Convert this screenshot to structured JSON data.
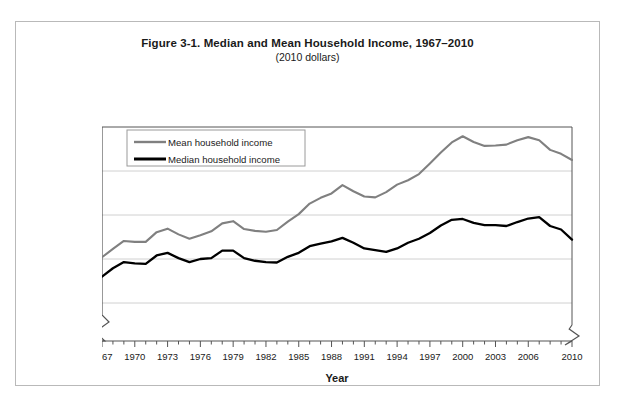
{
  "figure": {
    "title": "Figure 3-1. Median and Mean Household Income, 1967–2010",
    "subtitle": "(2010 dollars)"
  },
  "axes": {
    "y_title": "2010 dollars",
    "x_title": "Year",
    "y_ticks": [
      "75,000",
      "65,000",
      "55,000",
      "45,000",
      "35,000"
    ],
    "x_ticks": [
      "1967",
      "1970",
      "1973",
      "1976",
      "1979",
      "1982",
      "1985",
      "1988",
      "1991",
      "1994",
      "1997",
      "2000",
      "2003",
      "2006",
      "2010"
    ]
  },
  "legend": {
    "entries": [
      {
        "label": "Mean household income",
        "color": "#808080"
      },
      {
        "label": "Median household income",
        "color": "#000000"
      }
    ]
  },
  "colors": {
    "mean_line": "#808080",
    "median_line": "#000000",
    "gridline": "#d0d0d0",
    "axis": "#555555",
    "frame": "#b9b9b9"
  },
  "chart_data": {
    "type": "line",
    "title": "Figure 3-1. Median and Mean Household Income, 1967–2010",
    "subtitle": "(2010 dollars)",
    "xlabel": "Year",
    "ylabel": "2010 dollars",
    "ylim": [
      35000,
      75000
    ],
    "xlim": [
      1967,
      2010
    ],
    "grid": true,
    "y_axis_break": true,
    "legend_position": "upper-left-inside",
    "x": [
      1967,
      1968,
      1969,
      1970,
      1971,
      1972,
      1973,
      1974,
      1975,
      1976,
      1977,
      1978,
      1979,
      1980,
      1981,
      1982,
      1983,
      1984,
      1985,
      1986,
      1987,
      1988,
      1989,
      1990,
      1991,
      1992,
      1993,
      1994,
      1995,
      1996,
      1997,
      1998,
      1999,
      2000,
      2001,
      2002,
      2003,
      2004,
      2005,
      2006,
      2007,
      2008,
      2009,
      2010
    ],
    "series": [
      {
        "name": "Mean household income",
        "color": "#808080",
        "values": [
          45400,
          47300,
          49100,
          48900,
          48900,
          51100,
          51900,
          50600,
          49600,
          50400,
          51300,
          53100,
          53600,
          51800,
          51400,
          51200,
          51600,
          53500,
          55200,
          57600,
          58900,
          59900,
          61800,
          60400,
          59200,
          59000,
          60200,
          61900,
          62900,
          64300,
          66700,
          69200,
          71500,
          72900,
          71600,
          70700,
          70800,
          71000,
          72000,
          72700,
          72000,
          69800,
          68900,
          67500
        ]
      },
      {
        "name": "Median household income",
        "color": "#000000",
        "values": [
          41000,
          42900,
          44300,
          44000,
          43900,
          45800,
          46400,
          45200,
          44300,
          45000,
          45200,
          46900,
          46900,
          45200,
          44600,
          44300,
          44200,
          45500,
          46400,
          47900,
          48500,
          49000,
          49800,
          48700,
          47400,
          47000,
          46600,
          47400,
          48700,
          49600,
          50900,
          52600,
          53900,
          54100,
          53200,
          52700,
          52700,
          52500,
          53400,
          54200,
          54500,
          52500,
          51700,
          49400
        ]
      }
    ]
  }
}
